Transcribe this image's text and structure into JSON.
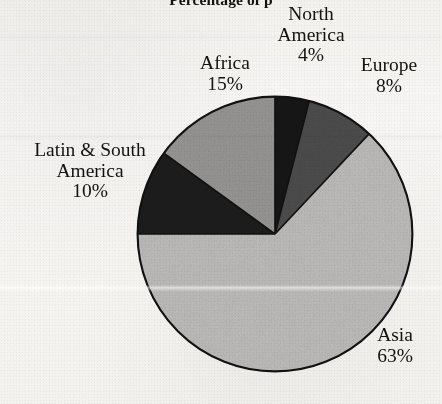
{
  "chart_data": {
    "type": "pie",
    "title": "Percentage of p",
    "subtitle": "",
    "xlabel": "",
    "ylabel": "",
    "legend_position": "none",
    "grid": false,
    "value_unit": "%",
    "total": 100,
    "start_angle_deg": 0,
    "direction": "clockwise",
    "categories": [
      "North America",
      "Europe",
      "Asia",
      "Latin & South America",
      "Africa"
    ],
    "values": [
      4,
      8,
      63,
      10,
      15
    ],
    "slices": [
      {
        "label": "North America",
        "label_lines": [
          "North",
          "America"
        ],
        "value": 4,
        "value_text": "4%",
        "color": "#141414",
        "start_deg": 0,
        "end_deg": 14.4
      },
      {
        "label": "Europe",
        "label_lines": [
          "Europe"
        ],
        "value": 8,
        "value_text": "8%",
        "color": "#4d4d4d",
        "start_deg": 14.4,
        "end_deg": 43.2
      },
      {
        "label": "Asia",
        "label_lines": [
          "Asia"
        ],
        "value": 63,
        "value_text": "63%",
        "color": "#bdbcba",
        "start_deg": 43.2,
        "end_deg": 270.0
      },
      {
        "label": "Latin & South America",
        "label_lines": [
          "Latin & South",
          "America"
        ],
        "value": 10,
        "value_text": "10%",
        "color": "#1c1c1c",
        "start_deg": 270.0,
        "end_deg": 306.0
      },
      {
        "label": "Africa",
        "label_lines": [
          "Africa"
        ],
        "value": 15,
        "value_text": "15%",
        "color": "#97[REPLACE]",
        "start_deg": 306.0,
        "end_deg": 360.0
      }
    ]
  },
  "labels": {
    "north_america": {
      "line1": "North",
      "line2": "America",
      "value": "4%"
    },
    "europe": {
      "line1": "Europe",
      "value": "8%"
    },
    "africa": {
      "line1": "Africa",
      "value": "15%"
    },
    "latin_south_america": {
      "line1": "Latin & South",
      "line2": "America",
      "value": "10%"
    },
    "asia": {
      "line1": "Asia",
      "value": "63%"
    }
  },
  "colors": {
    "north_america": "#141414",
    "europe": "#4d4d4d",
    "asia": "#bdbcba",
    "latin_south_america": "#1c1c1c",
    "africa": "#979695",
    "outline": "#111111",
    "paper": "#f5f4f1",
    "ink": "#14120f"
  }
}
